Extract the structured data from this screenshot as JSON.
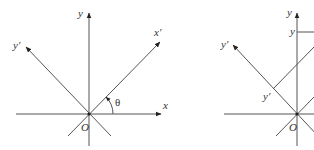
{
  "figure": {
    "left_panel": {
      "description": "Rotated coordinate axes x', y' by angle theta relative to x, y",
      "labels": {
        "y": "y",
        "x": "x",
        "x_prime": "x′",
        "y_prime": "y′",
        "origin": "O",
        "angle": "θ"
      }
    },
    "right_panel": {
      "description": "Projection of a point onto y and y' axes",
      "labels": {
        "y_axis": "y",
        "y_point": "y",
        "y_prime_axis": "y′",
        "y_prime_point": "y′",
        "origin": "O"
      }
    },
    "colors": {
      "line": "#555555",
      "text": "#333333",
      "background": "#ffffff"
    }
  }
}
